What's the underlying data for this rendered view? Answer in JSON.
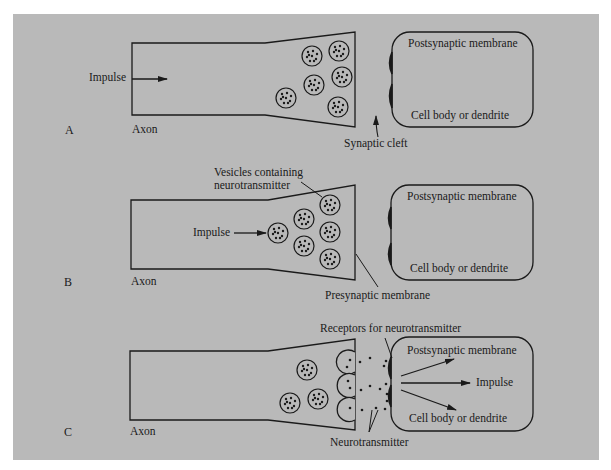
{
  "figure": {
    "background_color": "#b9b9b9",
    "ink_color": "#1a1a1a"
  },
  "panels": [
    {
      "letter": "A",
      "axon_label": "Axon",
      "impulse_label": "Impulse",
      "postsynaptic_label": "Postsynaptic membrane",
      "cell_body_label": "Cell body or dendrite",
      "callout": "Synaptic cleft"
    },
    {
      "letter": "B",
      "axon_label": "Axon",
      "impulse_label": "Impulse",
      "postsynaptic_label": "Postsynaptic membrane",
      "cell_body_label": "Cell body or dendrite",
      "vesicles_callout_line1": "Vesicles containing",
      "vesicles_callout_line2": "neurotransmitter",
      "callout": "Presynaptic membrane"
    },
    {
      "letter": "C",
      "axon_label": "Axon",
      "impulse_label": "Impulse",
      "postsynaptic_label": "Postsynaptic membrane",
      "cell_body_label": "Cell body or dendrite",
      "receptors_callout": "Receptors for neurotransmitter",
      "neurotransmitter_callout": "Neurotransmitter"
    }
  ]
}
